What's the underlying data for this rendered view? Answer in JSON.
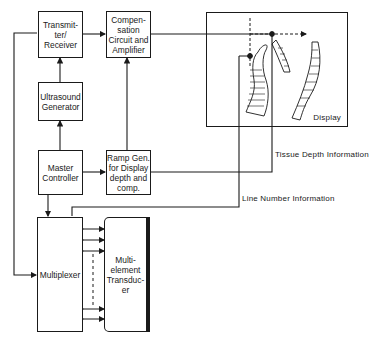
{
  "blocks": {
    "transmitter_receiver": "Transmit-\nter/\nReceiver",
    "compensation": "Compen-\nsation\nCircuit and\nAmplifier",
    "ultrasound_generator": "Ultrasound\nGenerator",
    "master_controller": "Master\nController",
    "ramp_generator": "Ramp Gen.\nfor Display\ndepth and\ncomp.",
    "multiplexer": "Multiplexer",
    "transducer": "Multi-\nelement\nTransduc-\ner",
    "display": "Display"
  },
  "signals": {
    "tissue_depth": "Tissue Depth Information",
    "line_number": "Line Number Information"
  }
}
